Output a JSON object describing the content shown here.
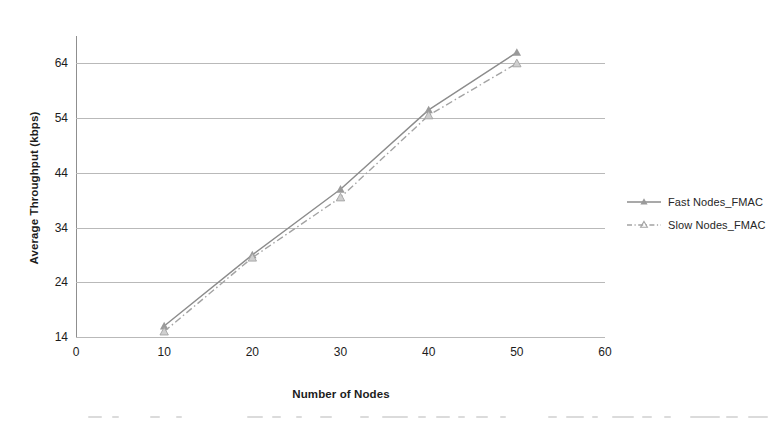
{
  "chart_data": {
    "type": "line",
    "title": "",
    "subtitle": "",
    "xlabel": "Number of Nodes",
    "ylabel": "Average Throughput (kbps)",
    "x": [
      10,
      20,
      30,
      40,
      50
    ],
    "xlim": [
      0,
      60
    ],
    "ylim": [
      14,
      69
    ],
    "x_ticks": [
      0,
      10,
      20,
      30,
      40,
      50,
      60
    ],
    "y_ticks": [
      14,
      24,
      34,
      44,
      54,
      64
    ],
    "grid": "horizontal",
    "legend_position": "right",
    "series": [
      {
        "name": "Fast Nodes_FMAC",
        "values": [
          16.0,
          29.0,
          41.0,
          55.5,
          66.0
        ],
        "line_style": "solid",
        "marker": "triangle",
        "color": "#8c8c8c"
      },
      {
        "name": "Slow Nodes_FMAC",
        "values": [
          15.0,
          28.5,
          39.5,
          54.5,
          64.0
        ],
        "line_style": "dash-dot",
        "marker": "triangle",
        "color": "#a3a3a3"
      }
    ],
    "annotations": []
  },
  "axes": {
    "y_title": "Average Throughput (kbps)",
    "x_title": "Number of Nodes",
    "y_tick_labels": [
      "64",
      "54",
      "44",
      "34",
      "24",
      "14"
    ],
    "x_tick_labels": [
      "0",
      "10",
      "20",
      "30",
      "40",
      "50",
      "60"
    ]
  },
  "legend": {
    "items": [
      {
        "label": "Fast Nodes_FMAC"
      },
      {
        "label": "Slow Nodes_FMAC"
      }
    ]
  },
  "colors": {
    "series_fast": "#8c8c8c",
    "series_slow": "#a3a3a3",
    "gridline": "#b9b9b9",
    "axis": "#8f8f8f",
    "text": "#1c1c1c",
    "background": "#ffffff"
  }
}
